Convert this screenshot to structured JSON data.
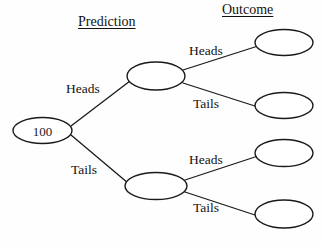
{
  "diagram": {
    "background_color": "#fefefe",
    "line_color": "#1a1a1a",
    "text_color": "#131313",
    "headings": [
      {
        "id": "prediction",
        "label": "Prediction",
        "underlined": true
      },
      {
        "id": "outcome",
        "label": "Outcome",
        "underlined": true
      }
    ],
    "nodes": [
      {
        "id": "root",
        "label": "100",
        "level": "start"
      },
      {
        "id": "pred-heads",
        "label": "",
        "level": "prediction"
      },
      {
        "id": "pred-tails",
        "label": "",
        "level": "prediction"
      },
      {
        "id": "out-hh",
        "label": "",
        "level": "outcome"
      },
      {
        "id": "out-ht",
        "label": "",
        "level": "outcome"
      },
      {
        "id": "out-th",
        "label": "",
        "level": "outcome"
      },
      {
        "id": "out-tt",
        "label": "",
        "level": "outcome"
      }
    ],
    "edges": [
      {
        "id": "e-root-heads",
        "from": "root",
        "to": "pred-heads",
        "label": "Heads"
      },
      {
        "id": "e-root-tails",
        "from": "root",
        "to": "pred-tails",
        "label": "Tails"
      },
      {
        "id": "e-ph-heads",
        "from": "pred-heads",
        "to": "out-hh",
        "label": "Heads"
      },
      {
        "id": "e-ph-tails",
        "from": "pred-heads",
        "to": "out-ht",
        "label": "Tails"
      },
      {
        "id": "e-pt-heads",
        "from": "pred-tails",
        "to": "out-th",
        "label": "Heads"
      },
      {
        "id": "e-pt-tails",
        "from": "pred-tails",
        "to": "out-tt",
        "label": "Tails"
      }
    ]
  }
}
